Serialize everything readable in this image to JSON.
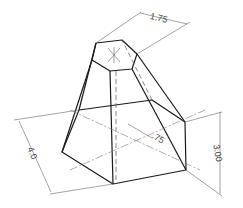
{
  "figure": {
    "dimensions": {
      "top_width": "1.75",
      "height": "3.00",
      "base_width": "4.0",
      "offset": ".75"
    },
    "colors": {
      "object_line": "#1a1a1a",
      "dimension_line": "#666666",
      "background": "#ffffff"
    }
  }
}
